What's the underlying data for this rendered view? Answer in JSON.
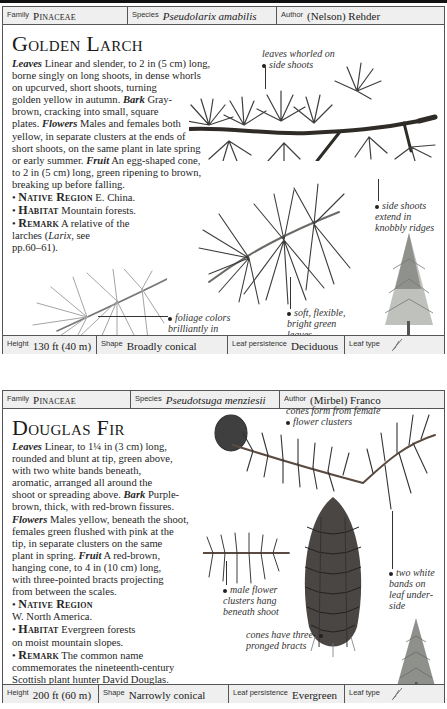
{
  "entries": [
    {
      "header": {
        "family_label": "Family",
        "family_value": "Pinaceae",
        "species_label": "Species",
        "species_value": "Pseudolarix amabilis",
        "author_label": "Author",
        "author_value": "(Nelson) Rehder"
      },
      "title": "Golden Larch",
      "description_lines": [
        [
          {
            "b": "Leaves"
          },
          {
            "t": " Linear and slender, to 2 in (5 cm) long,"
          }
        ],
        [
          {
            "t": "borne singly on long shoots, in dense whorls"
          }
        ],
        [
          {
            "t": "on upcurved, short shoots, turning"
          }
        ],
        [
          {
            "t": "golden yellow in autumn. "
          },
          {
            "b": "Bark"
          },
          {
            "t": " Gray-"
          }
        ],
        [
          {
            "t": "brown, cracking into small, square"
          }
        ],
        [
          {
            "t": "plates. "
          },
          {
            "b": "Flowers"
          },
          {
            "t": " Males and females both"
          }
        ],
        [
          {
            "t": "yellow, in separate clusters at the ends of"
          }
        ],
        [
          {
            "t": "short shoots, on the same plant in late spring"
          }
        ],
        [
          {
            "t": "or early summer. "
          },
          {
            "b": "Fruit"
          },
          {
            "t": " An egg-shaped cone,"
          }
        ],
        [
          {
            "t": "to 2 in (5 cm) long, green ripening to brown,"
          }
        ],
        [
          {
            "t": "breaking up before falling."
          }
        ],
        [
          {
            "t": "• "
          },
          {
            "k": "Native Region"
          },
          {
            "t": " E. China."
          }
        ],
        [
          {
            "t": "• "
          },
          {
            "k": "Habitat"
          },
          {
            "t": " Mountain forests."
          }
        ],
        [
          {
            "t": "• "
          },
          {
            "k": "Remark"
          },
          {
            "t": " A relative of the"
          }
        ],
        [
          {
            "t": "larches ("
          },
          {
            "i": "Larix"
          },
          {
            "t": ", see"
          }
        ],
        [
          {
            "t": "pp.60–61)."
          }
        ]
      ],
      "callouts": [
        {
          "lines": [
            "leaves whorled on",
            "side shoots"
          ]
        },
        {
          "lines": [
            "side shoots",
            "extend in",
            "knobbly ridges"
          ]
        },
        {
          "lines": [
            "foliage colors",
            "brilliantly in",
            "autumn"
          ]
        },
        {
          "lines": [
            "soft, flexible,",
            "bright green",
            "leaves"
          ]
        }
      ],
      "footer": {
        "height_label": "Height",
        "height_value": "130 ft (40 m)",
        "shape_label": "Shape",
        "shape_value": "Broadly conical",
        "persistence_label": "Leaf persistence",
        "persistence_value": "Deciduous",
        "leaftype_label": "Leaf type",
        "leaftype_icon": "needle-leaf-icon"
      }
    },
    {
      "header": {
        "family_label": "Family",
        "family_value": "Pinaceae",
        "species_label": "Species",
        "species_value": "Pseudotsuga menziesii",
        "author_label": "Author",
        "author_value": "(Mirbel) Franco"
      },
      "title": "Douglas Fir",
      "description_lines": [
        [
          {
            "b": "Leaves"
          },
          {
            "t": " Linear, to 1¼ in (3 cm) long,"
          }
        ],
        [
          {
            "t": "rounded and blunt at tip, green above,"
          }
        ],
        [
          {
            "t": "with two white bands beneath,"
          }
        ],
        [
          {
            "t": "aromatic, arranged all around the"
          }
        ],
        [
          {
            "t": "shoot or spreading above. "
          },
          {
            "b": "Bark"
          },
          {
            "t": " Purple-"
          }
        ],
        [
          {
            "t": "brown, thick, with red-brown fissures."
          }
        ],
        [
          {
            "b": "Flowers"
          },
          {
            "t": " Males yellow, beneath the shoot,"
          }
        ],
        [
          {
            "t": "females green flushed with pink at the"
          }
        ],
        [
          {
            "t": "tip, in separate clusters on the same"
          }
        ],
        [
          {
            "t": "plant in spring. "
          },
          {
            "b": "Fruit"
          },
          {
            "t": " A red-brown,"
          }
        ],
        [
          {
            "t": "hanging cone, to 4 in (10 cm) long,"
          }
        ],
        [
          {
            "t": "with three-pointed bracts projecting"
          }
        ],
        [
          {
            "t": "from between the scales."
          }
        ],
        [
          {
            "t": "• "
          },
          {
            "k": "Native Region"
          }
        ],
        [
          {
            "t": "W. North America."
          }
        ],
        [
          {
            "t": "• "
          },
          {
            "k": "Habitat"
          },
          {
            "t": " Evergreen forests"
          }
        ],
        [
          {
            "t": "on moist mountain slopes."
          }
        ],
        [
          {
            "t": "• "
          },
          {
            "k": "Remark"
          },
          {
            "t": " The common name"
          }
        ],
        [
          {
            "t": "commemorates the nineteenth-century"
          }
        ],
        [
          {
            "t": "Scottish plant hunter David Douglas."
          }
        ],
        [
          {
            "t": "Also known as Oregon fir, Oregon pine."
          }
        ]
      ],
      "callouts": [
        {
          "lines": [
            "cones form from female",
            "flower clusters"
          ]
        },
        {
          "lines": [
            "two white",
            "bands on",
            "leaf under-",
            "side"
          ]
        },
        {
          "lines": [
            "male flower",
            "clusters hang",
            "beneath shoot"
          ]
        },
        {
          "lines": [
            "cones have three-",
            "pronged bracts"
          ]
        }
      ],
      "footer": {
        "height_label": "Height",
        "height_value": "200 ft (60 m)",
        "shape_label": "Shape",
        "shape_value": "Narrowly conical",
        "persistence_label": "Leaf persistence",
        "persistence_value": "Evergreen",
        "leaftype_label": "Leaf type",
        "leaftype_icon": "needle-leaf-icon"
      }
    }
  ],
  "colors": {
    "strip_bg": "#efefef",
    "border": "#555555",
    "needle_dark": "#3a3d3a",
    "needle_light": "#9a9c98"
  }
}
